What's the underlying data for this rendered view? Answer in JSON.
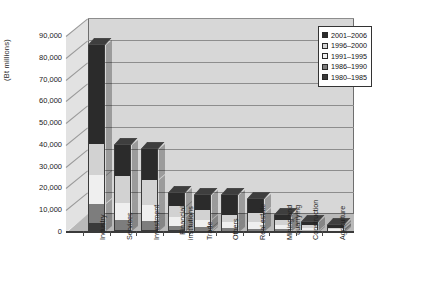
{
  "chart_data": {
    "type": "bar",
    "subtype": "stacked-bar-3d",
    "title": "",
    "xlabel": "",
    "ylabel": "(Bt millions)",
    "ylim": [
      0,
      90000
    ],
    "ytick_step": 10000,
    "ytick_labels": [
      "90,000",
      "80,000",
      "70,000",
      "60,000",
      "50,000",
      "40,000",
      "30,000",
      "20,000",
      "10,000",
      "0"
    ],
    "ytick_values": [
      90000,
      80000,
      70000,
      60000,
      50000,
      40000,
      30000,
      20000,
      10000,
      0
    ],
    "grid": true,
    "legend_position": "top-right",
    "categories": [
      "Industry",
      "Services",
      "Investment",
      "Financial institutions",
      "Trade",
      "Others",
      "Real estate",
      "Mining and quarrying",
      "Construction",
      "Agriculture"
    ],
    "series": [
      {
        "name": "1980-1985",
        "color": "#3a3a3a",
        "values": [
          4200,
          1100,
          900,
          700,
          600,
          500,
          400,
          300,
          200,
          150
        ]
      },
      {
        "name": "1986-1990",
        "color": "#7d7d7d",
        "values": [
          8800,
          4500,
          4200,
          2200,
          1500,
          1300,
          1100,
          900,
          500,
          400
        ]
      },
      {
        "name": "1991-1995",
        "color": "#efefef",
        "values": [
          13000,
          7800,
          7400,
          4200,
          3600,
          2600,
          3200,
          1800,
          1100,
          700
        ]
      },
      {
        "name": "1996-2000",
        "color": "#d2d2d2",
        "values": [
          14500,
          12500,
          11500,
          4700,
          4300,
          3300,
          4200,
          2300,
          1400,
          800
        ]
      },
      {
        "name": "2001-2006",
        "color": "#2b2b2b",
        "values": [
          45500,
          14100,
          14000,
          6200,
          7000,
          9300,
          6100,
          2700,
          1300,
          950
        ]
      }
    ],
    "totals": [
      86000,
      40000,
      38000,
      18000,
      17000,
      17000,
      15000,
      8000,
      4500,
      3000
    ]
  },
  "legend": {
    "entries": [
      {
        "label": "2001–2006",
        "color": "#2b2b2b"
      },
      {
        "label": "1996–2000",
        "color": "#d2d2d2"
      },
      {
        "label": "1991–1995",
        "color": "#efefef"
      },
      {
        "label": "1986–1990",
        "color": "#7d7d7d"
      },
      {
        "label": "1980–1985",
        "color": "#3a3a3a"
      }
    ]
  },
  "axis": {
    "y_title": "(Bt millions)"
  }
}
